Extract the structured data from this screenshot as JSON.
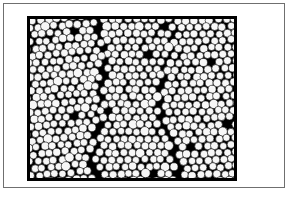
{
  "figure": {
    "kind": "micrograph",
    "caption_text": "",
    "canvas": {
      "width": 289,
      "height": 202
    },
    "background_color": "#ffffff"
  },
  "outer_frame": {
    "name": "plate-border",
    "x": 3,
    "y": 3,
    "width": 282,
    "height": 185,
    "stroke_color": "#6f6f6f",
    "stroke_width": 1,
    "fill_color": "#ffffff"
  },
  "micrograph_panel": {
    "name": "specimen-field",
    "x": 27,
    "y": 16,
    "width": 210,
    "height": 165,
    "border_color": "#000000",
    "border_width": 3,
    "interstitial_color": "#000000"
  },
  "packing": {
    "description": "two-dimensional close-packed monolayer of monodisperse spheres",
    "particle_fill_color": "#f7f7f7",
    "particle_stroke_color": "#0a0a0a",
    "particle_stroke_width": 0.6,
    "particle_diameter": 7.6,
    "lattice_spacing": 8.1,
    "lattice_type": "hexagonal",
    "rows": 22,
    "columns": 26,
    "jitter_amplitude": 0.9,
    "radius_variation": 0.5,
    "grain_boundaries": 3,
    "random_seed": 20250614
  },
  "defects": {
    "vacancy_probability": 0.012,
    "oversize_probability": 0.05,
    "oversize_scale": 1.22
  }
}
